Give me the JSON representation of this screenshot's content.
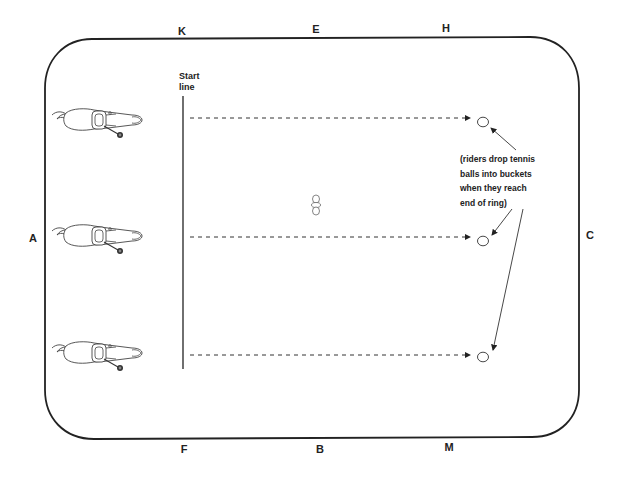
{
  "arena": {
    "border_color": "#222222",
    "markers": [
      {
        "letter": "K",
        "x": 182,
        "y": 31
      },
      {
        "letter": "E",
        "x": 316,
        "y": 29
      },
      {
        "letter": "H",
        "x": 446,
        "y": 28
      },
      {
        "letter": "A",
        "x": 33,
        "y": 238
      },
      {
        "letter": "C",
        "x": 590,
        "y": 235
      },
      {
        "letter": "F",
        "x": 184,
        "y": 449
      },
      {
        "letter": "B",
        "x": 320,
        "y": 449
      },
      {
        "letter": "M",
        "x": 449,
        "y": 447
      }
    ]
  },
  "start_line": {
    "label": "Start\nline",
    "x": 183,
    "y1": 96,
    "y2": 369
  },
  "riders": [
    {
      "name": "rider-1",
      "x": 50,
      "y": 107
    },
    {
      "name": "rider-2",
      "x": 50,
      "y": 223
    },
    {
      "name": "rider-3",
      "x": 50,
      "y": 340
    }
  ],
  "lanes": [
    {
      "y": 118,
      "x1": 190,
      "x2": 470
    },
    {
      "y": 237,
      "x1": 190,
      "x2": 470
    },
    {
      "y": 355,
      "x1": 190,
      "x2": 470
    }
  ],
  "buckets": [
    {
      "x": 483,
      "y": 122
    },
    {
      "x": 483,
      "y": 241
    },
    {
      "x": 483,
      "y": 357
    }
  ],
  "cone": {
    "x": 316,
    "y": 205
  },
  "note": {
    "text": "(riders drop tennis\nballs into buckets\nwhen they reach\nend of ring)"
  }
}
